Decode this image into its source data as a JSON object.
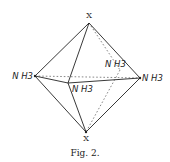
{
  "figure": {
    "caption": "Fig. 2.",
    "shape": "octahedron",
    "vertices": {
      "top": {
        "label": "X",
        "x": 89,
        "y": 23
      },
      "bottom": {
        "label": "X",
        "x": 86,
        "y": 132
      },
      "left": {
        "label": "N H3",
        "x": 35,
        "y": 76
      },
      "right": {
        "label": "N H3",
        "x": 140,
        "y": 78
      },
      "front": {
        "label": "N H3",
        "x": 68,
        "y": 83
      },
      "back": {
        "label": "N H3",
        "x": 120,
        "y": 70
      }
    },
    "colors": {
      "line": "#222222",
      "background": "#ffffff"
    }
  }
}
